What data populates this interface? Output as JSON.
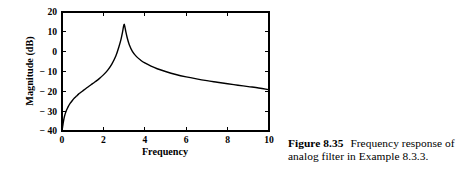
{
  "figure": {
    "caption_label": "Figure 8.35",
    "caption_body": "Frequency response of analog filter in Example 8.3.3."
  },
  "chart_data": {
    "type": "line",
    "title": "",
    "xlabel": "Frequency",
    "ylabel": "Magnitude (dB)",
    "xlim": [
      0,
      10
    ],
    "ylim": [
      -40,
      20
    ],
    "xticks": [
      0,
      2,
      4,
      6,
      8,
      10
    ],
    "xtick_labels": [
      "0",
      "2",
      "4",
      "6",
      "8",
      "10"
    ],
    "yticks": [
      20,
      10,
      0,
      -10,
      -20,
      -30,
      -40
    ],
    "ytick_labels": [
      "20",
      "10",
      "0",
      "− 10",
      "− 20",
      "− 30",
      "− 40"
    ],
    "grid": false,
    "legend": null,
    "frame": "box",
    "tick_direction": "in",
    "line_color": "#000000",
    "series": [
      {
        "name": "Magnitude",
        "x": [
          0.0,
          0.05,
          0.1,
          0.15,
          0.2,
          0.25,
          0.3,
          0.4,
          0.5,
          0.6,
          0.7,
          0.8,
          0.9,
          1.0,
          1.2,
          1.4,
          1.6,
          1.8,
          2.0,
          2.2,
          2.4,
          2.6,
          2.75,
          2.85,
          2.92,
          2.96,
          3.0,
          3.04,
          3.08,
          3.15,
          3.25,
          3.4,
          3.6,
          3.8,
          4.0,
          4.3,
          4.6,
          5.0,
          5.5,
          6.0,
          6.5,
          7.0,
          7.5,
          8.0,
          8.5,
          9.0,
          9.5,
          10.0
        ],
        "y": [
          -40.0,
          -36.5,
          -33.5,
          -31.5,
          -30.0,
          -28.8,
          -27.7,
          -26.0,
          -24.6,
          -23.4,
          -22.4,
          -21.4,
          -20.6,
          -19.8,
          -18.2,
          -16.7,
          -15.2,
          -13.6,
          -11.7,
          -9.4,
          -6.4,
          -2.2,
          2.5,
          6.2,
          9.6,
          12.0,
          13.8,
          12.4,
          10.2,
          7.0,
          3.5,
          0.2,
          -2.5,
          -4.3,
          -5.7,
          -7.3,
          -8.6,
          -10.0,
          -11.5,
          -12.7,
          -13.7,
          -14.6,
          -15.4,
          -16.2,
          -16.9,
          -17.6,
          -18.3,
          -19.2
        ]
      }
    ]
  }
}
